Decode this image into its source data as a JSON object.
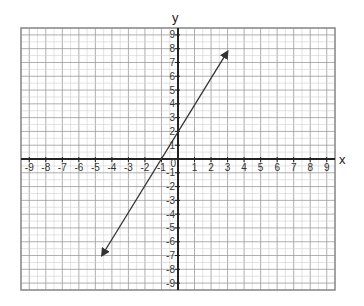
{
  "chart_data": {
    "type": "line",
    "title": "",
    "xlabel": "x",
    "ylabel": "y",
    "xlim": [
      -9.5,
      9.5
    ],
    "ylim": [
      -9.5,
      9.5
    ],
    "grid": true,
    "x_ticks": [
      -9,
      -8,
      -7,
      -6,
      -5,
      -4,
      -3,
      -2,
      -1,
      0,
      1,
      2,
      3,
      4,
      5,
      6,
      7,
      8,
      9
    ],
    "y_ticks": [
      -9,
      -8,
      -7,
      -6,
      -5,
      -4,
      -3,
      -2,
      -1,
      1,
      2,
      3,
      4,
      5,
      6,
      7,
      8,
      9
    ],
    "origin_label": "0",
    "series": [
      {
        "name": "line",
        "equation_estimate": "y = 2x + 2 (approx.)",
        "x": [
          -4.6,
          3.0
        ],
        "y": [
          -7.0,
          7.8
        ],
        "both_ends_arrows": true,
        "y_intercept_estimate": 2,
        "x_intercept_estimate": -1.1
      }
    ]
  },
  "colors": {
    "grid_minor": "#d0d0d0",
    "grid_major": "#9a9a9a",
    "axis": "#222222",
    "line": "#333333",
    "border": "#888888"
  }
}
